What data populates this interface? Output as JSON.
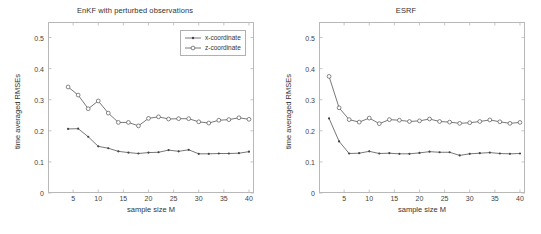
{
  "figure": {
    "width": 541,
    "height": 234,
    "background": "#ffffff",
    "line_color": "#555555",
    "text_color": "#333333"
  },
  "chart_data": [
    {
      "type": "line",
      "title": "EnKF with perturbed observations",
      "xlabel": "sample size M",
      "ylabel": "time averaged RMSEs",
      "xlim": [
        0,
        41
      ],
      "ylim": [
        0,
        0.55
      ],
      "xticks": [
        5,
        10,
        15,
        20,
        25,
        30,
        35,
        40
      ],
      "yticks": [
        0,
        0.1,
        0.2,
        0.3,
        0.4,
        0.5
      ],
      "xtick_labels": [
        "5",
        "10",
        "15",
        "20",
        "25",
        "30",
        "35",
        "40"
      ],
      "ytick_labels": [
        "0",
        "0.1",
        "0.2",
        "0.3",
        "0.4",
        "0.5"
      ],
      "grid": false,
      "legend_position": "upper right",
      "x": [
        4,
        6,
        8,
        10,
        12,
        14,
        16,
        18,
        20,
        22,
        24,
        26,
        28,
        30,
        32,
        34,
        36,
        38,
        40
      ],
      "series": [
        {
          "name": "x-coordinate",
          "marker": "dot",
          "values": [
            0.206,
            0.207,
            0.181,
            0.15,
            0.144,
            0.134,
            0.13,
            0.127,
            0.13,
            0.131,
            0.138,
            0.134,
            0.139,
            0.126,
            0.126,
            0.127,
            0.127,
            0.128,
            0.133
          ]
        },
        {
          "name": "z-coordinate",
          "marker": "circle",
          "values": [
            0.341,
            0.315,
            0.271,
            0.296,
            0.257,
            0.227,
            0.227,
            0.216,
            0.24,
            0.245,
            0.238,
            0.239,
            0.239,
            0.229,
            0.225,
            0.234,
            0.236,
            0.242,
            0.237
          ]
        }
      ]
    },
    {
      "type": "line",
      "title": "ESRF",
      "xlabel": "sample size M",
      "ylabel": "time averaged RMSEs",
      "xlim": [
        0,
        41
      ],
      "ylim": [
        0,
        0.55
      ],
      "xticks": [
        5,
        10,
        15,
        20,
        25,
        30,
        35,
        40
      ],
      "yticks": [
        0,
        0.1,
        0.2,
        0.3,
        0.4,
        0.5
      ],
      "xtick_labels": [
        "5",
        "10",
        "15",
        "20",
        "25",
        "30",
        "35",
        "40"
      ],
      "ytick_labels": [
        "0",
        "0.1",
        "0.2",
        "0.3",
        "0.4",
        "0.5"
      ],
      "grid": false,
      "legend_position": "upper right",
      "x": [
        2,
        4,
        6,
        8,
        10,
        12,
        14,
        16,
        18,
        20,
        22,
        24,
        26,
        28,
        30,
        32,
        34,
        36,
        38,
        40
      ],
      "series": [
        {
          "name": "x-coordinate",
          "marker": "dot",
          "values": [
            0.24,
            0.166,
            0.127,
            0.128,
            0.134,
            0.127,
            0.128,
            0.126,
            0.126,
            0.129,
            0.133,
            0.131,
            0.131,
            0.121,
            0.126,
            0.128,
            0.13,
            0.127,
            0.126,
            0.127
          ]
        },
        {
          "name": "z-coordinate",
          "marker": "circle",
          "values": [
            0.375,
            0.274,
            0.236,
            0.228,
            0.241,
            0.223,
            0.236,
            0.234,
            0.23,
            0.232,
            0.238,
            0.23,
            0.228,
            0.224,
            0.226,
            0.23,
            0.235,
            0.229,
            0.224,
            0.227
          ]
        }
      ]
    }
  ],
  "panels": [
    {
      "title": "EnKF with perturbed observations",
      "xlabel": "sample size M",
      "ylabel": "time averaged RMSEs",
      "legend": [
        {
          "label": "x-coordinate"
        },
        {
          "label": "z-coordinate"
        }
      ]
    },
    {
      "title": "ESRF",
      "xlabel": "sample size M",
      "ylabel": "time averaged RMSEs",
      "legend": [
        {
          "label": "x-coordinate"
        },
        {
          "label": "z-coordinate"
        }
      ]
    }
  ]
}
